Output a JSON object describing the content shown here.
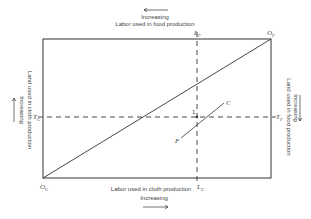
{
  "diagram": {
    "top": {
      "arrow_direction": "left",
      "increasing_label": "Increasing",
      "axis_label": "Labor used in food production"
    },
    "bottom": {
      "axis_label": "Labor used in cloth production",
      "increasing_label": "Increasing",
      "arrow_direction": "right"
    },
    "left": {
      "axis_label": "Land used in cloth production",
      "increasing_label": "Increasing",
      "arrow_direction": "up"
    },
    "right": {
      "axis_label": "Land used in food production",
      "increasing_label": "Increasing",
      "arrow_direction": "down"
    },
    "origins": {
      "cloth": {
        "main": "O",
        "sub": "C"
      },
      "food": {
        "main": "O",
        "sub": "F"
      }
    },
    "points": {
      "Lf": {
        "main": "L",
        "sub": "F"
      },
      "Lc": {
        "main": "L",
        "sub": "C"
      },
      "Tc": {
        "main": "T",
        "sub": "C"
      },
      "Tf": {
        "main": "T",
        "sub": "F"
      },
      "point1": "1",
      "C": "C",
      "F": "F"
    },
    "colors": {
      "line": "#333333",
      "background": "#ffffff"
    }
  }
}
